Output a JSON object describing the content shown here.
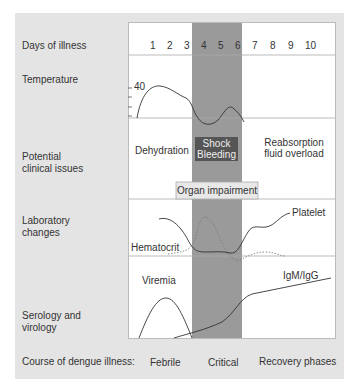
{
  "rows": {
    "days": "Days of illness",
    "temperature": "Temperature",
    "clinical": [
      "Potential",
      "clinical issues"
    ],
    "lab": [
      "Laboratory",
      "changes"
    ],
    "serology": [
      "Serology and",
      "virology"
    ],
    "course": "Course of dengue illness:"
  },
  "days": [
    "1",
    "2",
    "3",
    "4",
    "5",
    "6",
    "7",
    "8",
    "9",
    "10"
  ],
  "temperature_tick": "40",
  "clinical_issues": {
    "dehydration": "Dehydration",
    "shock": [
      "Shock",
      "Bleeding"
    ],
    "reabsorption": [
      "Reabsorption",
      "fluid overload"
    ],
    "organ": "Organ impairment"
  },
  "lab_labels": {
    "platelet": "Platelet",
    "hematocrit": "Hematocrit"
  },
  "serology_labels": {
    "viremia": "Viremia",
    "igm": "IgM/IgG"
  },
  "phases": {
    "febrile": "Febrile",
    "critical": "Critical",
    "recovery": "Recovery phases"
  },
  "colors": {
    "panel": "#e4e4e4",
    "critical_band": "#9a9a9a",
    "shock_box": "#555555",
    "organ_box": "#e8e8e8"
  }
}
